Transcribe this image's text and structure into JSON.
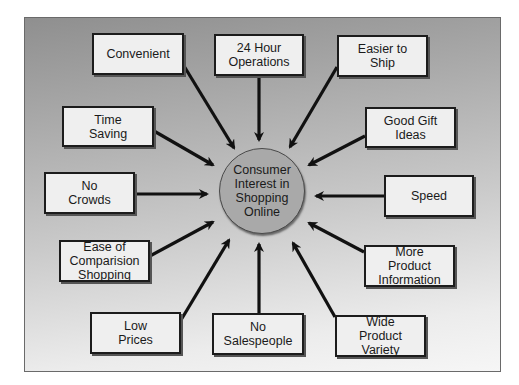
{
  "diagram": {
    "type": "hub-and-spoke",
    "center": {
      "label": "Consumer\nInterest in\nShopping\nOnline"
    },
    "nodes": [
      {
        "id": "convenient",
        "label": "Convenient"
      },
      {
        "id": "24-hour-operations",
        "label": "24 Hour\nOperations"
      },
      {
        "id": "easier-to-ship",
        "label": "Easier to\nShip"
      },
      {
        "id": "time-saving",
        "label": "Time\nSaving"
      },
      {
        "id": "good-gift-ideas",
        "label": "Good Gift\nIdeas"
      },
      {
        "id": "no-crowds",
        "label": "No\nCrowds"
      },
      {
        "id": "speed",
        "label": "Speed"
      },
      {
        "id": "ease-of-comparision-shopping",
        "label": "Ease of\nComparision\nShopping"
      },
      {
        "id": "more-product-information",
        "label": "More\nProduct\nInformation"
      },
      {
        "id": "low-prices",
        "label": "Low\nPrices"
      },
      {
        "id": "no-salespeople",
        "label": "No\nSalespeople"
      },
      {
        "id": "wide-product-variety",
        "label": "Wide\nProduct\nVariety"
      }
    ],
    "edges_direction": "node-to-center"
  }
}
